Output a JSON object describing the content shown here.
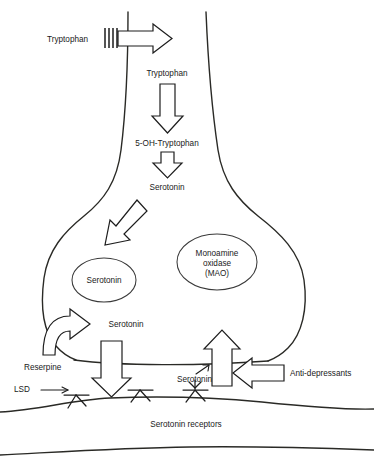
{
  "diagram": {
    "labels": {
      "tryptophan_extracellular": "Tryptophan",
      "tryptophan_intracellular": "Tryptophan",
      "hydroxytryptophan": "5-OH-Tryptophan",
      "serotonin_synthesized": "Serotonin",
      "serotonin_vesicle": "Serotonin",
      "mao_line1": "Monoamine",
      "mao_line2": "oxidase",
      "mao_line3": "(MAO)",
      "serotonin_cytoplasm": "Serotonin",
      "reserpine": "Reserpine",
      "lsd": "LSD",
      "serotonin_cleft": "Serotonin",
      "antidepressants": "Anti-depressants",
      "serotonin_receptors": "Serotonin receptors"
    },
    "icons": {
      "transporter": "membrane-transporter-hatch-icon",
      "vesicle": "vesicle-ellipse-icon",
      "receptor": "serotonin-receptor-icon",
      "block_arrow_down": "block-arrow-down-icon",
      "block_arrow_right": "block-arrow-right-icon",
      "block_arrow_left": "block-arrow-left-icon",
      "block_arrow_up": "block-arrow-up-icon",
      "block_arrow_diagonal": "block-arrow-diagonal-icon",
      "curved_arrow": "curved-block-arrow-icon",
      "thin_arrow": "thin-line-arrow-icon"
    },
    "colors": {
      "background": "#ffffff",
      "stroke": "#1d1d1d",
      "membrane": "#2a2a26",
      "vesicle_stroke": "#3a3a3a",
      "text": "#1a1a1a"
    }
  }
}
